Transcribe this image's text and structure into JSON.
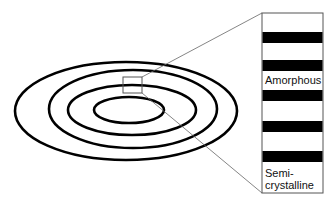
{
  "diagram": {
    "colors": {
      "background": "#ffffff",
      "ring_stroke": "#000000",
      "band_fill": "#000000",
      "callout_stroke": "#666666",
      "box_stroke": "#555555"
    },
    "rings": [
      {
        "cx": 126,
        "cy": 111,
        "rx": 111,
        "ry": 49
      },
      {
        "cx": 133,
        "cy": 109,
        "rx": 84,
        "ry": 39
      },
      {
        "cx": 132,
        "cy": 110,
        "rx": 64,
        "ry": 25
      },
      {
        "cx": 129,
        "cy": 110,
        "rx": 35,
        "ry": 13
      }
    ],
    "zoom_region": {
      "x": 123,
      "y": 77,
      "width": 19,
      "height": 16
    },
    "detail_box": {
      "x": 262,
      "y": 13,
      "width": 61,
      "height": 180
    },
    "bands": [
      {
        "y": 32,
        "height": 11
      },
      {
        "y": 60,
        "height": 11
      },
      {
        "y": 90,
        "height": 11
      },
      {
        "y": 121,
        "height": 11
      },
      {
        "y": 151,
        "height": 11
      }
    ],
    "labels": {
      "amorphous": "Amorphous",
      "semicrystalline_line1": "Semi-",
      "semicrystalline_line2": "crystalline"
    }
  }
}
